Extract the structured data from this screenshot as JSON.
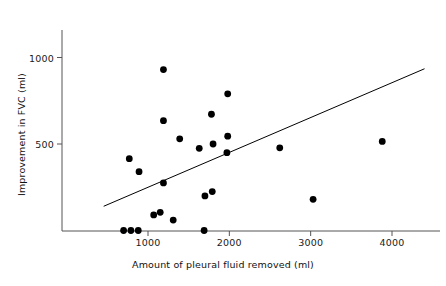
{
  "chart_data": {
    "type": "scatter",
    "title": "",
    "xlabel": "Amount of pleural fluid removed (ml)",
    "ylabel": "Improvement in FVC (ml)",
    "xlim": [
      400,
      4450
    ],
    "ylim": [
      -40,
      1230
    ],
    "xticks": [
      1000,
      2000,
      3000,
      4000
    ],
    "xtick_labels": [
      "1000",
      "2000",
      "3000",
      "4000"
    ],
    "yticks": [
      500,
      1000
    ],
    "ytick_labels": [
      "500",
      "1000"
    ],
    "grid": false,
    "legend": null,
    "marker": "filled-circle",
    "marker_color": "#000000",
    "marker_size_px": 3.4,
    "points": [
      {
        "x": 700,
        "y": 0
      },
      {
        "x": 790,
        "y": 0
      },
      {
        "x": 880,
        "y": 0
      },
      {
        "x": 1690,
        "y": 0
      },
      {
        "x": 1310,
        "y": 60
      },
      {
        "x": 1070,
        "y": 90
      },
      {
        "x": 1150,
        "y": 105
      },
      {
        "x": 3030,
        "y": 180
      },
      {
        "x": 1700,
        "y": 200
      },
      {
        "x": 1790,
        "y": 225
      },
      {
        "x": 1190,
        "y": 275
      },
      {
        "x": 890,
        "y": 340
      },
      {
        "x": 770,
        "y": 415
      },
      {
        "x": 1970,
        "y": 450
      },
      {
        "x": 1630,
        "y": 475
      },
      {
        "x": 2620,
        "y": 478
      },
      {
        "x": 1800,
        "y": 500
      },
      {
        "x": 3880,
        "y": 515
      },
      {
        "x": 1390,
        "y": 530
      },
      {
        "x": 1980,
        "y": 545
      },
      {
        "x": 1190,
        "y": 635
      },
      {
        "x": 1780,
        "y": 672
      },
      {
        "x": 1980,
        "y": 790
      },
      {
        "x": 1190,
        "y": 930
      }
    ],
    "fit_line": {
      "type": "linear-regression",
      "x_start": 455,
      "y_start": 140,
      "x_end": 4400,
      "y_end": 935,
      "color": "#000000",
      "width_px": 1
    },
    "axis_color": "#555555",
    "axis_width_px": 1
  }
}
